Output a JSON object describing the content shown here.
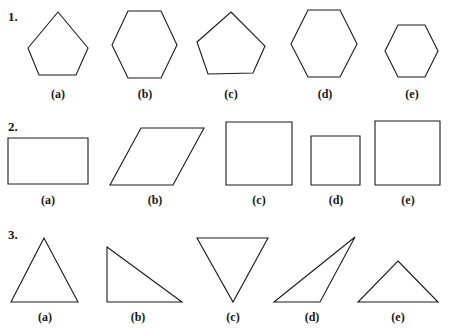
{
  "page": {
    "background_color": "#ffffff",
    "stroke_color": "#1a1a1a",
    "text_color": "#151515",
    "width": 449,
    "height": 330
  },
  "rows": [
    {
      "number": "1.",
      "category": "pentagons-and-hexagons",
      "items": [
        {
          "label": "(a)",
          "shape": "pentagon",
          "points": "58,12 88,48 76,75 39,75 28,48"
        },
        {
          "label": "(b)",
          "shape": "hexagon",
          "points": "128,11 161,11 177,45 161,78 128,78 112,45"
        },
        {
          "label": "(c)",
          "shape": "pentagon-irregular",
          "points": "231,12 265,46 253,73 208,74 197,42"
        },
        {
          "label": "(d)",
          "shape": "hexagon",
          "points": "308,10 340,10 357,44 340,77 308,77 291,44"
        },
        {
          "label": "(e)",
          "shape": "hexagon-small",
          "points": "398,25 425,25 438,51 425,77 398,77 385,51"
        }
      ]
    },
    {
      "number": "2.",
      "category": "quadrilaterals",
      "items": [
        {
          "label": "(a)",
          "shape": "rectangle",
          "points": "8,138 88,138 88,184 8,184"
        },
        {
          "label": "(b)",
          "shape": "parallelogram",
          "points": "141,128 204,128 173,185 110,185"
        },
        {
          "label": "(c)",
          "shape": "square",
          "points": "226,122 292,122 292,185 226,185"
        },
        {
          "label": "(d)",
          "shape": "square-small",
          "points": "311,136 360,136 360,185 311,185"
        },
        {
          "label": "(e)",
          "shape": "square-large",
          "points": "375,121 440,121 440,185 375,185"
        }
      ]
    },
    {
      "number": "3.",
      "category": "triangles",
      "items": [
        {
          "label": "(a)",
          "shape": "triangle-isosceles",
          "points": "44,238 78,302 11,302"
        },
        {
          "label": "(b)",
          "shape": "triangle-right",
          "points": "107,247 182,302 107,302"
        },
        {
          "label": "(c)",
          "shape": "triangle-inverted",
          "points": "197,238 268,238 233,302"
        },
        {
          "label": "(d)",
          "shape": "triangle-obtuse",
          "points": "355,237 320,302 274,302"
        },
        {
          "label": "(e)",
          "shape": "triangle-wide",
          "points": "398,261 438,302 358,302"
        }
      ]
    }
  ],
  "labels": {
    "row1": [
      {
        "text": "(a)",
        "x": 38,
        "y": 88
      },
      {
        "text": "(b)",
        "x": 125,
        "y": 88
      },
      {
        "text": "(c)",
        "x": 211,
        "y": 88
      },
      {
        "text": "(d)",
        "x": 305,
        "y": 88
      },
      {
        "text": "(e)",
        "x": 392,
        "y": 88
      }
    ],
    "row2": [
      {
        "text": "(a)",
        "x": 28,
        "y": 194
      },
      {
        "text": "(b)",
        "x": 135,
        "y": 194
      },
      {
        "text": "(c)",
        "x": 239,
        "y": 194
      },
      {
        "text": "(d)",
        "x": 316,
        "y": 194
      },
      {
        "text": "(e)",
        "x": 388,
        "y": 194
      }
    ],
    "row3": [
      {
        "text": "(a)",
        "x": 25,
        "y": 311
      },
      {
        "text": "(b)",
        "x": 118,
        "y": 311
      },
      {
        "text": "(c)",
        "x": 213,
        "y": 311
      },
      {
        "text": "(d)",
        "x": 292,
        "y": 311
      },
      {
        "text": "(e)",
        "x": 378,
        "y": 311
      }
    ]
  },
  "row_numbers": [
    {
      "text": "1.",
      "x": 8,
      "y": 10
    },
    {
      "text": "2.",
      "x": 8,
      "y": 120
    },
    {
      "text": "3.",
      "x": 8,
      "y": 228
    }
  ]
}
